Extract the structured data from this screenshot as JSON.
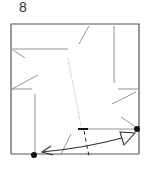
{
  "diagram": {
    "step_number": "8",
    "type": "origami-fold-step",
    "colors": {
      "outline": "#555555",
      "crease": "#888888",
      "dot": "#111111",
      "arrow": "#333333",
      "valley": "#999999"
    },
    "elements": {
      "square": "paper-outline",
      "dots": [
        "reference-point-bottom-left",
        "reference-point-right"
      ],
      "arrow": "fold-arrow-double-headed",
      "dotted_line": "valley-fold-line",
      "dashed_line": "mountain-fold-line"
    }
  }
}
